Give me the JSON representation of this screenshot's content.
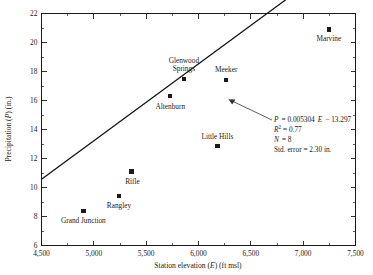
{
  "chart_data": {
    "type": "scatter",
    "title": "",
    "xlabel": "Station elevation (E) (ft msl)",
    "xlabel_parts": {
      "pre": "Station elevation (",
      "sym": "E",
      "post": ") (ft msl)"
    },
    "ylabel": "Precipitation (P) (in.)",
    "ylabel_parts": {
      "pre": "Precipitation (",
      "sym": "P",
      "post": ") (in.)"
    },
    "xlim": [
      4500,
      7500
    ],
    "ylim": [
      6,
      22
    ],
    "xticks": [
      4500,
      5000,
      5500,
      6000,
      6500,
      7000,
      7500
    ],
    "xtick_labels": [
      "4,500",
      "5,000",
      "5,500",
      "6,000",
      "6,500",
      "7,000",
      "7,500"
    ],
    "yticks": [
      6,
      8,
      10,
      12,
      14,
      16,
      18,
      20,
      22
    ],
    "ytick_labels": [
      "6",
      "8",
      "10",
      "12",
      "14",
      "16",
      "18",
      "20",
      "22"
    ],
    "x_minor_step": 250,
    "y_minor_step": 1,
    "grid": false,
    "legend": "none",
    "marker": "filled-square",
    "points": [
      {
        "name": "Grand Junction",
        "x": 4900,
        "y": 8.4,
        "label_dx": 0,
        "label_dy": 12,
        "label_anchor": "middle"
      },
      {
        "name": "Rangley",
        "x": 5240,
        "y": 9.4,
        "label_dx": 0,
        "label_dy": 12,
        "label_anchor": "middle"
      },
      {
        "name": "Rifle",
        "x": 5360,
        "y": 11.1,
        "label_dx": 1,
        "label_dy": 12,
        "label_anchor": "middle"
      },
      {
        "name": "Altenburn",
        "x": 5730,
        "y": 16.3,
        "label_dx": 0,
        "label_dy": 13,
        "label_anchor": "middle"
      },
      {
        "name": "Glenwood Springs",
        "x": 5860,
        "y": 17.5,
        "label_dx": 0,
        "label_dy": -8,
        "label_anchor": "middle"
      },
      {
        "name": "Little Hills",
        "x": 6180,
        "y": 12.85,
        "label_dx": 0,
        "label_dy": -7,
        "label_anchor": "middle"
      },
      {
        "name": "Meeker",
        "x": 6265,
        "y": 17.4,
        "label_dx": 0,
        "label_dy": -8,
        "label_anchor": "middle"
      },
      {
        "name": "Marvine",
        "x": 7245,
        "y": 20.9,
        "label_dx": 0,
        "label_dy": 12,
        "label_anchor": "middle"
      }
    ],
    "fit": {
      "slope": 0.005304,
      "intercept": -13.297,
      "x_start": 4500,
      "x_end": 7340
    },
    "annotation": {
      "equation": {
        "lhs": "P",
        "rhs_a": "= 0.005304",
        "rhs_var": "E",
        "rhs_b": "− 13.297"
      },
      "r_squared": {
        "sym": "R",
        "sup": "2",
        "value": "= 0.77"
      },
      "n": {
        "sym": "N",
        "value": "= 8"
      },
      "std_error": "Std. error = 2.30 in."
    }
  }
}
